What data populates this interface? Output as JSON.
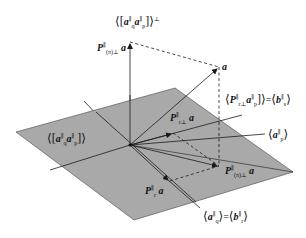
{
  "diagram": {
    "colors": {
      "plane_fill": "#a9a9a9",
      "plane_stroke": "#444444",
      "line": "#1a1a1a",
      "background": "#ffffff"
    },
    "labels": {
      "perp_subspace": "⟨[a_q^∥ a_p^∥]⟩^⊥",
      "proj_perp": "P^∥_(π)^⊥ a",
      "vector_a": "a",
      "range_Pr_ap": "⟨P^∥_r⊥ a_p^∥]⟩ = ⟨b_s^∥⟩",
      "plane_span": "⟨[a_q^∥ a_p^∥]⟩",
      "proj_r_perp": "P^∥_r⊥ a",
      "a_p_span": "⟨a_p^∥⟩",
      "proj_pi": "P^∥_(π)^⊥ a",
      "proj_r": "P^∥_r a",
      "a_q_span": "⟨a_q^∥⟩ = ⟨b_r^∥⟩"
    },
    "text": {
      "perp_subspace": {
        "a1": "a",
        "s1": "q",
        "a2": "a",
        "s2": "p",
        "sup": "∥",
        "perp": "⊥"
      },
      "proj_perp": {
        "P": "P",
        "sup": "∥",
        "sub": "(π)⊥",
        "a": "a"
      },
      "vector_a": "a",
      "range_Pr_ap": {
        "P": "P",
        "sub": "r⊥",
        "a": "a",
        "asub": "p",
        "eq": "=",
        "b": "b",
        "bsub": "s",
        "sup": "∥"
      },
      "plane_span": {
        "a1": "a",
        "s1": "q",
        "a2": "a",
        "s2": "p",
        "sup": "∥"
      },
      "proj_r_perp": {
        "P": "P",
        "sup": "∥",
        "sub": "r⊥",
        "a": "a"
      },
      "a_p_span": {
        "a": "a",
        "sub": "p",
        "sup": "∥"
      },
      "proj_pi": {
        "P": "P",
        "sup": "∥",
        "sub": "(π)⊥",
        "a": "a"
      },
      "proj_r": {
        "P": "P",
        "sup": "∥",
        "sub": "r",
        "a": "a"
      },
      "a_q_span": {
        "a": "a",
        "sub": "q",
        "eq": "=",
        "b": "b",
        "bsub": "r",
        "sup": "∥"
      }
    }
  }
}
